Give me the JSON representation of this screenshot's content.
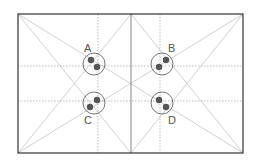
{
  "diagram": {
    "type": "composition-grid",
    "frame": {
      "x": 18,
      "y": 14,
      "width": 225,
      "height": 139,
      "stroke": "#333333"
    },
    "center_divider_x": 131,
    "dotted_verticals_x": [
      98,
      160
    ],
    "dotted_horizontals_y": [
      66,
      101
    ],
    "guide_color": "#bbbbbb",
    "dot_color": "#555555",
    "points": [
      {
        "label": "A",
        "cx": 94,
        "cy": 64,
        "label_x": 84,
        "label_y": 52,
        "dots": [
          [
            91,
            60
          ],
          [
            97,
            67
          ]
        ]
      },
      {
        "label": "B",
        "cx": 162,
        "cy": 64,
        "label_x": 168,
        "label_y": 52,
        "dots": [
          [
            166,
            60
          ],
          [
            159,
            67
          ]
        ]
      },
      {
        "label": "C",
        "cx": 94,
        "cy": 103,
        "label_x": 84,
        "label_y": 124,
        "dots": [
          [
            97,
            101
          ],
          [
            90,
            108
          ]
        ]
      },
      {
        "label": "D",
        "cx": 162,
        "cy": 103,
        "label_x": 168,
        "label_y": 124,
        "dots": [
          [
            159,
            101
          ],
          [
            166,
            108
          ]
        ]
      }
    ]
  }
}
